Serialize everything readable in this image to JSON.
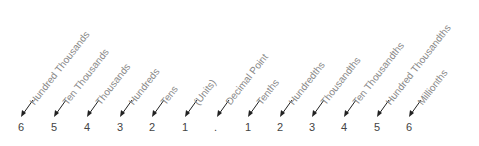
{
  "columns": [
    {
      "digit": "6",
      "label": "Hundred Thousands",
      "x": 22
    },
    {
      "digit": "5",
      "label": "Ten Thousands",
      "x": 55
    },
    {
      "digit": "4",
      "label": "Thousands",
      "x": 88
    },
    {
      "digit": "3",
      "label": "Hundreds",
      "x": 121
    },
    {
      "digit": "2",
      "label": "Tens",
      "x": 153
    },
    {
      "digit": "1",
      "label": "(Units)",
      "x": 186
    },
    {
      "digit": ".",
      "label": "Decimal Point",
      "x": 218
    },
    {
      "digit": "1",
      "label": "Tenths",
      "x": 249
    },
    {
      "digit": "2",
      "label": "Hundredths",
      "x": 281
    },
    {
      "digit": "3",
      "label": "Thousandths",
      "x": 313
    },
    {
      "digit": "4",
      "label": "Ten Thousandths",
      "x": 345
    },
    {
      "digit": "5",
      "label": "Hundred Thousandths",
      "x": 378
    },
    {
      "digit": "6",
      "label": "Millionths",
      "x": 410
    }
  ]
}
